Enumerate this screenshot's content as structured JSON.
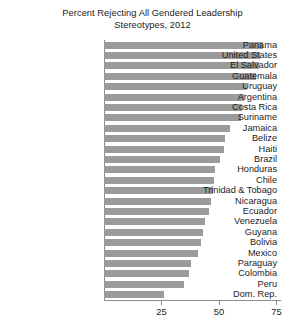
{
  "chart_data": {
    "type": "bar",
    "orientation": "horizontal",
    "title": "Percent Rejecting All Gendered Leadership Stereotypes, 2012",
    "title_lines": [
      "Percent Rejecting All Gendered Leadership",
      "Stereotypes, 2012"
    ],
    "xlabel": "",
    "ylabel": "",
    "xlim": [
      0,
      77
    ],
    "xticks": [
      25,
      50,
      75
    ],
    "xtick_labels": [
      "25",
      "50",
      "75"
    ],
    "grid": false,
    "legend": null,
    "bar_color": "#9b9b9b",
    "axis_color": "#8e8e8e",
    "categories": [
      "Panama",
      "United States",
      "El Salvador",
      "Guatemala",
      "Uruguay",
      "Argentina",
      "Costa Rica",
      "Suriname",
      "Jamaica",
      "Belize",
      "Haiti",
      "Brazil",
      "Honduras",
      "Chile",
      "Trinidad & Tobago",
      "Nicaragua",
      "Ecuador",
      "Venezuela",
      "Guyana",
      "Bolivia",
      "Mexico",
      "Paraguay",
      "Colombia",
      "Peru",
      "Dom. Rep."
    ],
    "values": [
      69.0,
      68.0,
      67.5,
      66.0,
      62.0,
      61.0,
      60.0,
      59.5,
      55.0,
      52.5,
      52.0,
      50.5,
      48.5,
      48.0,
      47.5,
      46.5,
      45.5,
      44.0,
      43.0,
      42.0,
      41.0,
      38.0,
      37.0,
      35.0,
      26.0
    ]
  }
}
